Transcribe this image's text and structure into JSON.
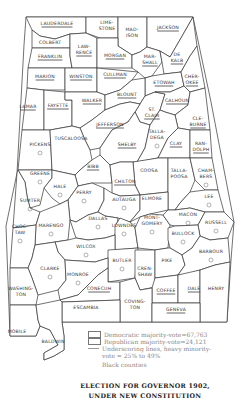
{
  "map": {
    "title_line1": "ELECTION FOR GOVERNOR 1902,",
    "title_line2": "UNDER NEW CONSTITUTION",
    "region": "Alabama counties",
    "counties": [
      {
        "name": "LAUDERDALE",
        "underlined": true
      },
      {
        "name": "LIME-",
        "name2": "STONE",
        "underlined": false
      },
      {
        "name": "MAD-",
        "name2": "ISON",
        "underlined": false
      },
      {
        "name": "JACKSON",
        "underlined": true
      },
      {
        "name": "COLBERT",
        "underlined": false
      },
      {
        "name": "LAW-",
        "name2": "RENCE",
        "underlined": true
      },
      {
        "name": "FRANKLIN",
        "underlined": true
      },
      {
        "name": "MORGAN",
        "underlined": true
      },
      {
        "name": "MAR-",
        "name2": "SHALL",
        "underlined": true
      },
      {
        "name": "DE",
        "name2": "KALB",
        "underlined": true
      },
      {
        "name": "MARION",
        "underlined": true
      },
      {
        "name": "WINSTON",
        "underlined": true
      },
      {
        "name": "CULLMAN",
        "underlined": true
      },
      {
        "name": "ETOWAH",
        "underlined": true
      },
      {
        "name": "CHER-",
        "name2": "OKEE",
        "underlined": true
      },
      {
        "name": "LAMAR",
        "underlined": true
      },
      {
        "name": "FAYETTE",
        "underlined": true
      },
      {
        "name": "WALKER",
        "underlined": true
      },
      {
        "name": "BLOUNT",
        "underlined": true
      },
      {
        "name": "ST.",
        "name2": "CLAIR",
        "underlined": true
      },
      {
        "name": "CALHOUN",
        "underlined": true
      },
      {
        "name": "CLE-",
        "name2": "BURNE",
        "underlined": true
      },
      {
        "name": "JEFFERSON",
        "underlined": true
      },
      {
        "name": "PICKENS",
        "underlined": false,
        "black": true
      },
      {
        "name": "TUSCALOOSA",
        "underlined": false
      },
      {
        "name": "SHELBY",
        "underlined": true
      },
      {
        "name": "TALLA-",
        "name2": "DEGA",
        "underlined": false,
        "black": true
      },
      {
        "name": "CLAY",
        "underlined": true
      },
      {
        "name": "RAN-",
        "name2": "DOLPH",
        "underlined": true
      },
      {
        "name": "BIBB",
        "underlined": true
      },
      {
        "name": "COOSA",
        "underlined": false
      },
      {
        "name": "TALLA-",
        "name2": "POOSA",
        "underlined": false
      },
      {
        "name": "CHAM-",
        "name2": "BERS",
        "underlined": false,
        "black": true
      },
      {
        "name": "GREENE",
        "underlined": false,
        "black": true
      },
      {
        "name": "HALE",
        "underlined": false,
        "black": true
      },
      {
        "name": "CHILTON",
        "underlined": true
      },
      {
        "name": "SUMTER",
        "underlined": false,
        "black": true
      },
      {
        "name": "PERRY",
        "underlined": false,
        "black": true
      },
      {
        "name": "AUTAUGA",
        "underlined": false,
        "black": true
      },
      {
        "name": "ELMORE",
        "underlined": false
      },
      {
        "name": "LEE",
        "underlined": false,
        "black": true
      },
      {
        "name": "MACON",
        "underlined": false,
        "black": true
      },
      {
        "name": "RUSSELL",
        "underlined": false,
        "black": true
      },
      {
        "name": "CHOC-",
        "name2": "TAW",
        "underlined": false,
        "black": true
      },
      {
        "name": "MARENGO",
        "underlined": false,
        "black": true
      },
      {
        "name": "DALLAS",
        "underlined": false,
        "black": true
      },
      {
        "name": "LOWNDES",
        "underlined": false,
        "black": true
      },
      {
        "name": "MONT-",
        "name2": "GOMERY",
        "underlined": false,
        "black": true
      },
      {
        "name": "BULLOCK",
        "underlined": false,
        "black": true
      },
      {
        "name": "WILCOX",
        "underlined": false,
        "black": true
      },
      {
        "name": "BARBOUR",
        "underlined": false,
        "black": true
      },
      {
        "name": "CLARKE",
        "underlined": false,
        "black": true
      },
      {
        "name": "MONROE",
        "underlined": false,
        "black": true
      },
      {
        "name": "BUTLER",
        "underlined": false,
        "black": true
      },
      {
        "name": "CREN-",
        "name2": "SHAW",
        "underlined": false
      },
      {
        "name": "PIKE",
        "underlined": false
      },
      {
        "name": "WASHING-",
        "name2": "TON",
        "underlined": false
      },
      {
        "name": "CONECUH",
        "underlined": true
      },
      {
        "name": "COFFEE",
        "underlined": true
      },
      {
        "name": "DALE",
        "underlined": true
      },
      {
        "name": "HENRY",
        "underlined": false
      },
      {
        "name": "ESCAMBIA",
        "underlined": false
      },
      {
        "name": "COVING-",
        "name2": "TON",
        "underlined": false
      },
      {
        "name": "GENEVA",
        "underlined": true
      },
      {
        "name": "MOBILE",
        "underlined": false
      },
      {
        "name": "BALDWIN",
        "underlined": false
      }
    ]
  },
  "legend": {
    "items": [
      {
        "symbol": "box",
        "label": "Democratic majority-vote=67,763"
      },
      {
        "symbol": "box",
        "label": "Republican majority-vote=24,121"
      },
      {
        "symbol": "underline",
        "label": "Underscoring lines, heavy minority-",
        "label2": "vote = 25% to 49%"
      },
      {
        "symbol": "circle",
        "label": "Black counties"
      }
    ]
  }
}
